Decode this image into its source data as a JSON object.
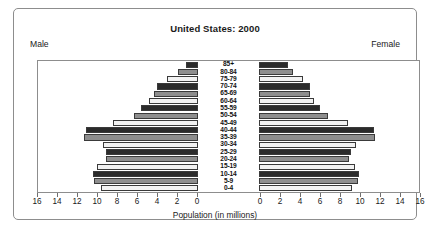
{
  "top_clipped_text": "· · ·",
  "chart": {
    "title": "United States: 2000",
    "male_label": "Male",
    "female_label": "Female",
    "axis_title": "Population (in millions)"
  },
  "chart_data": {
    "type": "bar",
    "subtype": "population-pyramid",
    "title": "United States: 2000",
    "xlabel": "Population (in millions)",
    "ylabel": "",
    "orientation": "horizontal",
    "grid": false,
    "legend": "none",
    "left_side_label": "Male",
    "right_side_label": "Female",
    "axis_max": 16,
    "axis_tick_step": 2,
    "left_tick_labels": [
      "16",
      "14",
      "12",
      "10",
      "8",
      "6",
      "4",
      "2",
      "0"
    ],
    "right_tick_labels": [
      "0",
      "2",
      "4",
      "6",
      "8",
      "10",
      "12",
      "14",
      "16"
    ],
    "categories": [
      "85+",
      "80-84",
      "75-79",
      "70-74",
      "65-69",
      "60-64",
      "55-59",
      "50-54",
      "45-49",
      "40-44",
      "35-39",
      "30-34",
      "25-29",
      "20-24",
      "15-19",
      "10-14",
      "5-9",
      "0-4"
    ],
    "series": [
      {
        "name": "Male",
        "side": "left",
        "values": [
          1.2,
          2.0,
          3.1,
          4.1,
          4.4,
          4.9,
          5.7,
          6.4,
          8.5,
          11.2,
          11.4,
          9.5,
          9.2,
          9.2,
          10.1,
          10.5,
          10.4,
          9.7
        ]
      },
      {
        "name": "Female",
        "side": "right",
        "values": [
          2.9,
          3.4,
          4.4,
          5.1,
          5.1,
          5.5,
          6.1,
          6.9,
          8.9,
          11.5,
          11.6,
          9.7,
          9.2,
          9.0,
          9.6,
          10.0,
          9.9,
          9.3
        ]
      }
    ],
    "fill_cycle": [
      "#2b2b2b",
      "#8e8e8e",
      "#f2f2f2"
    ],
    "bar_border_color": "#3a3a3a"
  }
}
